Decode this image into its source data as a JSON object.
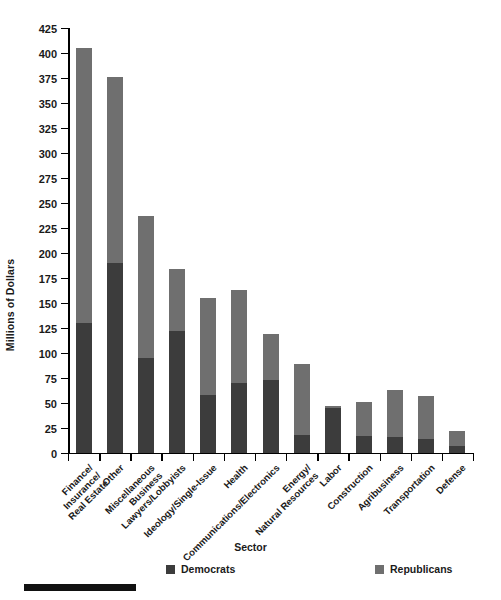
{
  "chart_data": {
    "type": "bar",
    "subtype": "stacked-vertical",
    "title": "",
    "xlabel": "Sector",
    "ylabel": "Millions of Dollars",
    "ylim": [
      0,
      425
    ],
    "ytick_step": 25,
    "yticks": [
      0,
      25,
      50,
      75,
      100,
      125,
      150,
      175,
      200,
      225,
      250,
      275,
      300,
      325,
      350,
      375,
      400,
      425
    ],
    "ytick_labels": [
      "0",
      "25",
      "50",
      "75",
      "100",
      "125",
      "150",
      "175",
      "200",
      "225",
      "250",
      "275",
      "300",
      "325",
      "350",
      "375",
      "400",
      "425"
    ],
    "grid": false,
    "legend_position": "bottom",
    "categories": [
      "Finance/\nInsurance/\nReal Estate",
      "Other",
      "Miscellaneous\nBusiness",
      "Lawyers/Lobbyists",
      "Ideology/Single-Issue",
      "Health",
      "Communications/Electronics",
      "Energy/\nNatural Resources",
      "Labor",
      "Construction",
      "Agribusiness",
      "Transportation",
      "Defense"
    ],
    "series": [
      {
        "name": "Democrats",
        "color": "#3c3c3c",
        "values": [
          130,
          190,
          95,
          122,
          58,
          70,
          73,
          18,
          45,
          17,
          16,
          14,
          7
        ]
      },
      {
        "name": "Republicans",
        "color": "#6f6f6f",
        "values": [
          275,
          186,
          142,
          62,
          97,
          93,
          46,
          71,
          2,
          34,
          47,
          43,
          15
        ]
      }
    ],
    "totals": [
      405,
      376,
      237,
      184,
      155,
      163,
      119,
      89,
      47,
      51,
      63,
      57,
      22
    ]
  },
  "axes": {
    "y_title": "Millions of Dollars",
    "x_title": "Sector"
  },
  "legend": {
    "items": [
      {
        "label": "Democrats",
        "color": "#3c3c3c"
      },
      {
        "label": "Republicans",
        "color": "#6f6f6f"
      }
    ]
  }
}
